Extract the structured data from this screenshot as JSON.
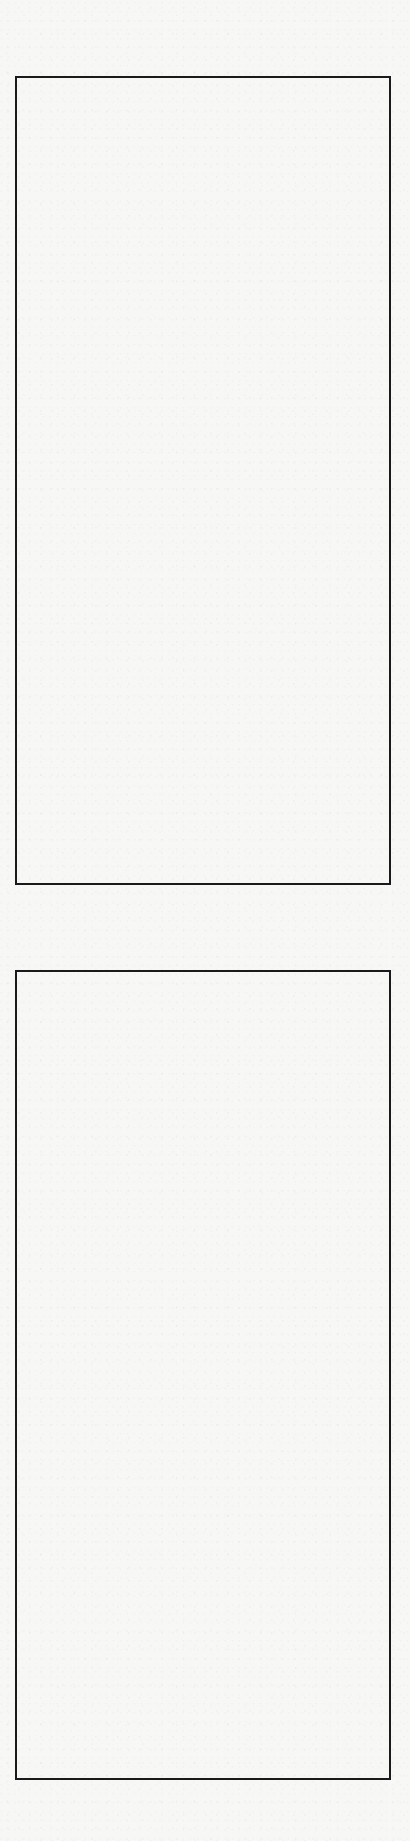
{
  "page": {
    "background_color": "#f7f7f6",
    "border_color": "#1a1a1a",
    "boxes": [
      {
        "id": "box-1",
        "left": 15,
        "top": 76,
        "width": 376,
        "height": 809,
        "content": ""
      },
      {
        "id": "box-2",
        "left": 15,
        "top": 970,
        "width": 376,
        "height": 810,
        "content": ""
      }
    ]
  }
}
